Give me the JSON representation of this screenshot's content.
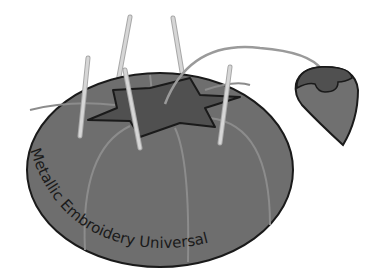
{
  "illustration": {
    "subject": "tomato pincushion with strawberry emery and needles",
    "labels": {
      "left": "Metallic",
      "middle": "Embroidery",
      "right": "Universal"
    },
    "colors": {
      "background": "#ffffff",
      "tomato_body": "#6e6e6e",
      "tomato_seam": "#8c8c8c",
      "calyx_star": "#505050",
      "outline": "#1a1a1a",
      "needle": "#c8c8c8",
      "strawberry": "#707070",
      "strawberry_cap": "#505050",
      "string": "#9a9a9a"
    },
    "needle_count": 5
  }
}
